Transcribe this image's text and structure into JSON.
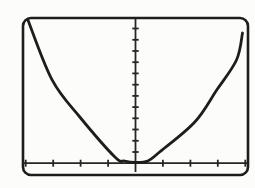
{
  "colors": {
    "ink": "#1d1d1d",
    "axis": "#262626",
    "paper": "#fcfcfb"
  },
  "chart_data": {
    "type": "line",
    "title": "",
    "xlabel": "",
    "ylabel": "",
    "grid": false,
    "legend": false,
    "window": {
      "xmin": -4.1,
      "xmax": 4.1,
      "xscl": 1,
      "ymin": -1.05,
      "ymax": 12.85,
      "yscl": 1
    },
    "x_axis": {
      "position_y": 0,
      "from": -4.1,
      "to": 4.08,
      "tick_values": [
        -4,
        -3,
        -2,
        -1,
        1,
        2,
        3,
        4
      ]
    },
    "y_axis": {
      "position_x": 0,
      "from": -0.78,
      "to": 12.85,
      "tick_values": [
        1,
        2,
        3,
        4,
        5,
        6,
        7,
        8,
        9,
        10,
        11,
        12
      ]
    },
    "series": [
      {
        "name": "parabola",
        "points": [
          [
            -3.92,
            12.76
          ],
          [
            -3.04,
            7.42
          ],
          [
            -2.03,
            4.12
          ],
          [
            -0.75,
            0.55
          ],
          [
            -0.4,
            0.2
          ],
          [
            0.0,
            0.06
          ],
          [
            0.45,
            0.2
          ],
          [
            0.88,
            1.0
          ],
          [
            2.16,
            3.67
          ],
          [
            2.96,
            6.52
          ],
          [
            3.68,
            9.2
          ],
          [
            3.9,
            11.6
          ]
        ]
      }
    ]
  }
}
